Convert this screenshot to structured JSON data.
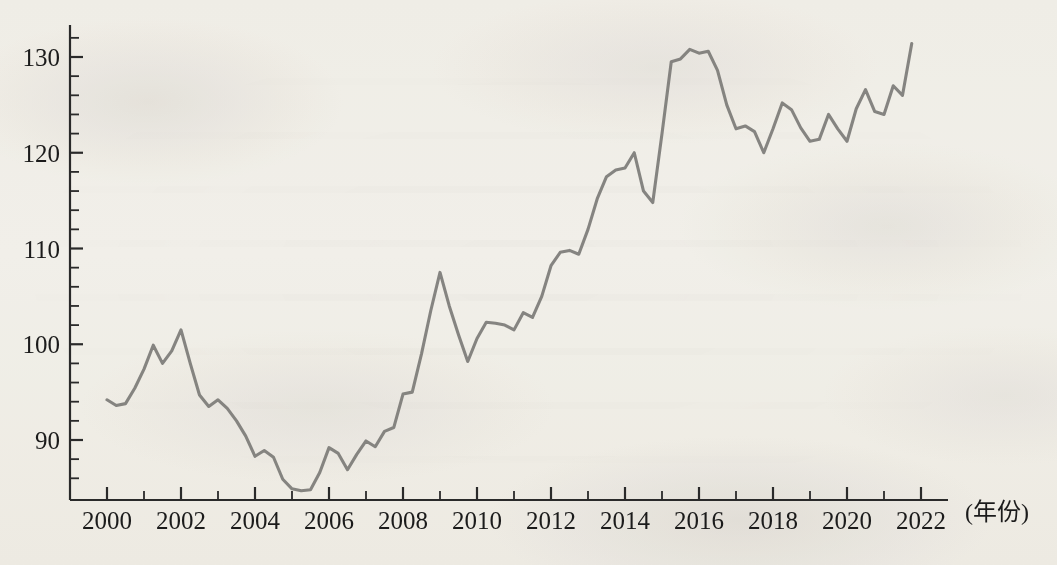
{
  "figure": {
    "background_color": "#f7f6f3",
    "line_color": "#7d7c79",
    "axis_color": "#2a2a2a",
    "x_unit_label": "(年份)",
    "y_axis_title": "",
    "title": ""
  },
  "axes": {
    "y_ticks": [
      "90",
      "100",
      "110",
      "120",
      "130"
    ],
    "y_tick_values": [
      90,
      100,
      110,
      120,
      130
    ],
    "y_minor_step": 2,
    "y_min": 84.0,
    "y_max": 133.0,
    "x_ticks": [
      "2000",
      "2002",
      "2004",
      "2006",
      "2008",
      "2010",
      "2012",
      "2014",
      "2016",
      "2018",
      "2020",
      "2022"
    ],
    "x_tick_values": [
      2000,
      2002,
      2004,
      2006,
      2008,
      2010,
      2012,
      2014,
      2016,
      2018,
      2020,
      2022
    ],
    "x_minor_step": 1,
    "x_min": 1999.0,
    "x_max": 2022.2
  },
  "chart_data": {
    "type": "line",
    "title": "",
    "subtitle": "",
    "xlabel": "(年份)",
    "ylabel": "",
    "xlim": [
      1999.0,
      2022.2
    ],
    "ylim": [
      84.0,
      133.0
    ],
    "grid": false,
    "legend": null,
    "legend_position": "none",
    "x_tick_labels": [
      "2000",
      "2002",
      "2004",
      "2006",
      "2008",
      "2010",
      "2012",
      "2014",
      "2016",
      "2018",
      "2020",
      "2022"
    ],
    "y_tick_labels": [
      "90",
      "100",
      "110",
      "120",
      "130"
    ],
    "series": [
      {
        "name": "index",
        "color": "#7d7c79",
        "x": [
          2000.0,
          2000.25,
          2000.5,
          2000.75,
          2001.0,
          2001.25,
          2001.5,
          2001.75,
          2002.0,
          2002.25,
          2002.5,
          2002.75,
          2003.0,
          2003.25,
          2003.5,
          2003.75,
          2004.0,
          2004.25,
          2004.5,
          2004.75,
          2005.0,
          2005.25,
          2005.5,
          2005.75,
          2006.0,
          2006.25,
          2006.5,
          2006.75,
          2007.0,
          2007.25,
          2007.5,
          2007.75,
          2008.0,
          2008.25,
          2008.5,
          2008.75,
          2009.0,
          2009.25,
          2009.5,
          2009.75,
          2010.0,
          2010.25,
          2010.5,
          2010.75,
          2011.0,
          2011.25,
          2011.5,
          2011.75,
          2012.0,
          2012.25,
          2012.5,
          2012.75,
          2013.0,
          2013.25,
          2013.5,
          2013.75,
          2014.0,
          2014.25,
          2014.5,
          2014.75,
          2015.0,
          2015.25,
          2015.5,
          2015.75,
          2016.0,
          2016.25,
          2016.5,
          2016.75,
          2017.0,
          2017.25,
          2017.5,
          2017.75,
          2018.0,
          2018.25,
          2018.5,
          2018.75,
          2019.0,
          2019.25,
          2019.5,
          2019.75,
          2020.0,
          2020.25,
          2020.5,
          2020.75,
          2021.0,
          2021.25,
          2021.5,
          2021.75
        ],
        "values": [
          94.2,
          93.6,
          93.8,
          95.4,
          97.4,
          99.9,
          98.0,
          99.3,
          101.5,
          98.0,
          94.7,
          93.5,
          94.2,
          93.3,
          92.0,
          90.4,
          88.3,
          88.9,
          88.2,
          85.9,
          84.9,
          84.7,
          84.8,
          86.6,
          89.2,
          88.6,
          86.9,
          88.5,
          89.9,
          89.3,
          90.9,
          91.3,
          94.8,
          95.0,
          99.0,
          103.5,
          107.5,
          104.0,
          101.0,
          98.2,
          100.6,
          102.3,
          102.2,
          102.0,
          101.5,
          103.3,
          102.8,
          105.0,
          108.2,
          109.6,
          109.8,
          109.4,
          112.0,
          115.2,
          117.5,
          118.2,
          118.4,
          120.0,
          116.0,
          114.8,
          122.0,
          129.5,
          129.8,
          130.8,
          130.4,
          130.6,
          128.6,
          125.0,
          122.5,
          122.8,
          122.2,
          120.0,
          122.5,
          125.2,
          124.5,
          122.6,
          121.2,
          121.4,
          124.0,
          122.5,
          121.2,
          124.6,
          126.6,
          124.3,
          124.0,
          127.0,
          126.0,
          131.4
        ]
      }
    ]
  }
}
